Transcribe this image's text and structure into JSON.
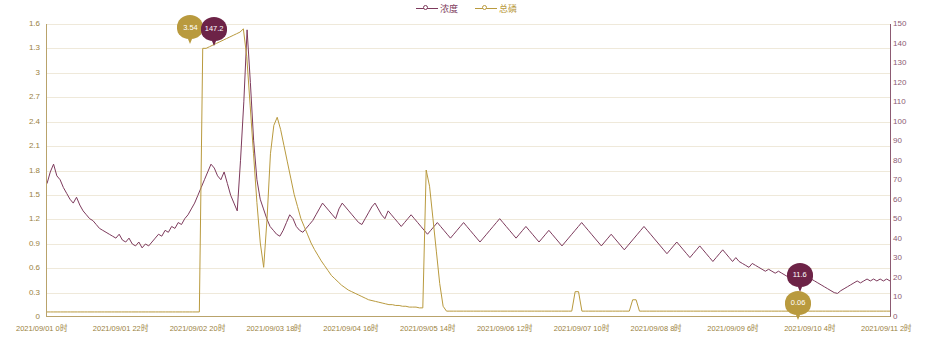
{
  "chart_data": {
    "type": "line",
    "title": "",
    "xlabel": "",
    "ylabel": "",
    "grid": true,
    "legend_position": "top-center",
    "legend": [
      {
        "name": "浓度",
        "color": "#7d3a5c",
        "marker": "circle-open"
      },
      {
        "name": "总磷",
        "color": "#b99a3e",
        "marker": "circle-open"
      }
    ],
    "x_axis": {
      "tick_labels": [
        "2021/09/01 0时",
        "2021/09/01 22时",
        "2021/09/02 20时",
        "2021/09/03 18时",
        "2021/09/04 16时",
        "2021/09/05 14时",
        "2021/09/06 12时",
        "2021/09/07 10时",
        "2021/09/08 8时",
        "2021/09/09 6时",
        "2021/09/10 4时",
        "2021/09/11 2时"
      ]
    },
    "y_axis_left": {
      "color": "#9a8241",
      "tick_labels": [
        "0",
        "0.3",
        "0.6",
        "0.9",
        "1.2",
        "1.5",
        "1.8",
        "2.1",
        "2.4",
        "2.7",
        "3",
        "1.3",
        "1.6"
      ],
      "ticks": [
        0,
        0.3,
        0.6,
        0.9,
        1.2,
        1.5,
        1.8,
        2.1,
        2.4,
        2.7,
        3.0,
        3.3,
        3.6
      ],
      "range": [
        0,
        3.6
      ]
    },
    "y_axis_right": {
      "color": "#8c5a72",
      "tick_labels": [
        "0",
        "10",
        "20",
        "30",
        "40",
        "50",
        "60",
        "70",
        "80",
        "90",
        "100",
        "110",
        "120",
        "130",
        "140",
        "150"
      ],
      "ticks": [
        0,
        10,
        20,
        30,
        40,
        50,
        60,
        70,
        80,
        90,
        100,
        110,
        120,
        130,
        140,
        150
      ],
      "range": [
        0,
        150
      ]
    },
    "annotations": [
      {
        "label": "3.54",
        "series": "总磷",
        "color": "#b99a3e",
        "x_pct": 17.1,
        "y_pct": 1.5
      },
      {
        "label": "147.2",
        "series": "浓度",
        "color": "#6d2347",
        "x_pct": 19.9,
        "y_pct": 2.0
      },
      {
        "label": "11.6",
        "series": "浓度",
        "color": "#6d2347",
        "x_pct": 89.2,
        "y_pct": 86.0
      },
      {
        "label": "0.06",
        "series": "总磷",
        "color": "#b99a3e",
        "x_pct": 89.0,
        "y_pct": 95.5
      }
    ],
    "series": [
      {
        "name": "浓度",
        "color": "#7d3a5c",
        "axis": "right",
        "values": [
          68,
          74,
          78,
          72,
          70,
          66,
          63,
          60,
          58,
          61,
          57,
          54,
          52,
          50,
          49,
          47,
          45,
          44,
          43,
          42,
          41,
          40,
          42,
          39,
          38,
          40,
          37,
          36,
          38,
          35,
          37,
          36,
          38,
          40,
          42,
          41,
          44,
          43,
          46,
          45,
          48,
          47,
          50,
          52,
          55,
          58,
          62,
          66,
          70,
          74,
          78,
          76,
          72,
          70,
          74,
          68,
          62,
          58,
          54,
          80,
          110,
          147,
          120,
          90,
          70,
          60,
          55,
          50,
          46,
          44,
          42,
          41,
          44,
          48,
          52,
          50,
          46,
          44,
          43,
          45,
          47,
          49,
          52,
          55,
          58,
          56,
          54,
          52,
          50,
          55,
          58,
          56,
          54,
          52,
          50,
          48,
          47,
          50,
          53,
          56,
          58,
          55,
          52,
          50,
          54,
          52,
          50,
          48,
          46,
          48,
          50,
          52,
          50,
          48,
          46,
          44,
          42,
          44,
          46,
          48,
          46,
          44,
          42,
          40,
          42,
          44,
          46,
          48,
          46,
          44,
          42,
          40,
          38,
          40,
          42,
          44,
          46,
          48,
          50,
          48,
          46,
          44,
          42,
          40,
          42,
          44,
          46,
          44,
          42,
          40,
          38,
          40,
          42,
          44,
          42,
          40,
          38,
          36,
          38,
          40,
          42,
          44,
          46,
          48,
          46,
          44,
          42,
          40,
          38,
          36,
          38,
          40,
          42,
          40,
          38,
          36,
          34,
          36,
          38,
          40,
          42,
          44,
          46,
          44,
          42,
          40,
          38,
          36,
          34,
          32,
          34,
          36,
          38,
          36,
          34,
          32,
          30,
          32,
          34,
          36,
          34,
          32,
          30,
          28,
          30,
          32,
          34,
          32,
          30,
          28,
          30,
          28,
          27,
          26,
          25,
          27,
          26,
          25,
          24,
          23,
          24,
          23,
          22,
          23,
          22,
          21,
          20,
          21,
          20,
          19,
          20,
          19,
          18,
          19,
          18,
          17,
          16,
          15,
          14,
          13,
          12,
          11.6,
          13,
          14,
          15,
          16,
          17,
          18,
          17,
          18,
          19,
          18,
          19,
          18,
          19,
          18,
          19,
          18
        ]
      },
      {
        "name": "总磷",
        "color": "#b99a3e",
        "axis": "left",
        "values": [
          0.05,
          0.05,
          0.05,
          0.05,
          0.05,
          0.05,
          0.05,
          0.05,
          0.05,
          0.05,
          0.05,
          0.05,
          0.05,
          0.05,
          0.05,
          0.05,
          0.05,
          0.05,
          0.05,
          0.05,
          0.05,
          0.05,
          0.05,
          0.05,
          0.05,
          0.05,
          0.05,
          0.05,
          0.05,
          0.05,
          0.05,
          0.05,
          0.05,
          0.05,
          0.05,
          0.05,
          0.05,
          0.05,
          0.05,
          0.05,
          0.05,
          0.05,
          0.05,
          0.05,
          0.05,
          0.05,
          3.3,
          3.3,
          3.32,
          3.34,
          3.36,
          3.38,
          3.4,
          3.42,
          3.44,
          3.46,
          3.48,
          3.5,
          3.54,
          3.2,
          2.6,
          2.0,
          1.4,
          0.9,
          0.6,
          1.2,
          2.0,
          2.35,
          2.45,
          2.3,
          2.1,
          1.9,
          1.7,
          1.5,
          1.35,
          1.2,
          1.1,
          1.0,
          0.9,
          0.82,
          0.75,
          0.68,
          0.62,
          0.56,
          0.5,
          0.46,
          0.42,
          0.38,
          0.35,
          0.32,
          0.3,
          0.28,
          0.26,
          0.24,
          0.22,
          0.2,
          0.19,
          0.18,
          0.17,
          0.16,
          0.15,
          0.14,
          0.14,
          0.13,
          0.13,
          0.12,
          0.12,
          0.11,
          0.11,
          0.11,
          0.1,
          0.1,
          1.8,
          1.6,
          1.2,
          0.8,
          0.4,
          0.12,
          0.06,
          0.06,
          0.06,
          0.06,
          0.06,
          0.06,
          0.06,
          0.06,
          0.06,
          0.06,
          0.06,
          0.06,
          0.06,
          0.06,
          0.06,
          0.06,
          0.06,
          0.06,
          0.06,
          0.06,
          0.06,
          0.06,
          0.06,
          0.06,
          0.06,
          0.06,
          0.06,
          0.06,
          0.06,
          0.06,
          0.06,
          0.06,
          0.06,
          0.06,
          0.06,
          0.06,
          0.06,
          0.06,
          0.3,
          0.3,
          0.06,
          0.06,
          0.06,
          0.06,
          0.06,
          0.06,
          0.06,
          0.06,
          0.06,
          0.06,
          0.06,
          0.06,
          0.06,
          0.06,
          0.06,
          0.2,
          0.2,
          0.06,
          0.06,
          0.06,
          0.06,
          0.06,
          0.06,
          0.06,
          0.06,
          0.06,
          0.06,
          0.06,
          0.06,
          0.06,
          0.06,
          0.06,
          0.06,
          0.06,
          0.06,
          0.06,
          0.06,
          0.06,
          0.06,
          0.06,
          0.06,
          0.06,
          0.06,
          0.06,
          0.06,
          0.06,
          0.06,
          0.06,
          0.06,
          0.06,
          0.06,
          0.06,
          0.06,
          0.06,
          0.06,
          0.06,
          0.06,
          0.06,
          0.06,
          0.06,
          0.06,
          0.06,
          0.06,
          0.06,
          0.06,
          0.06,
          0.06,
          0.06,
          0.06,
          0.06,
          0.06,
          0.06,
          0.06,
          0.06,
          0.06,
          0.06,
          0.06,
          0.06,
          0.06,
          0.06,
          0.06,
          0.06,
          0.06,
          0.06,
          0.06,
          0.06,
          0.06,
          0.06,
          0.06,
          0.06,
          0.06,
          0.06
        ]
      }
    ]
  }
}
